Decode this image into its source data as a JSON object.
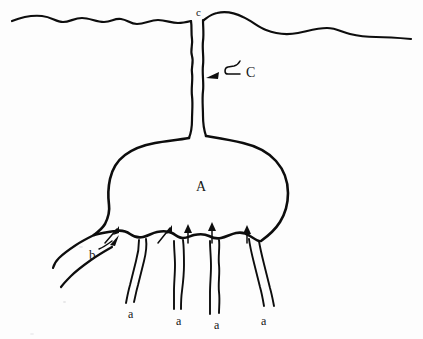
{
  "figure": {
    "type": "line-drawing-diagram",
    "background_color": "#fdfdfd",
    "ink_color": "#0d0d0d",
    "width": 423,
    "height": 339
  },
  "labels": {
    "body": "A",
    "neck_upper": "c",
    "neck_arrow": "C",
    "thick_root": "b",
    "roots": [
      "a",
      "a",
      "a",
      "a"
    ]
  },
  "label_positions": {
    "body": {
      "x": 196,
      "y": 180
    },
    "neck_upper": {
      "x": 196,
      "y": 7
    },
    "neck_arrow": {
      "x": 246,
      "y": 66
    },
    "thick_root": {
      "x": 89,
      "y": 248
    },
    "roots": [
      {
        "x": 128,
        "y": 308
      },
      {
        "x": 176,
        "y": 315
      },
      {
        "x": 214,
        "y": 319
      },
      {
        "x": 261,
        "y": 315
      }
    ]
  },
  "annotations": {
    "neck_arrow_direction": "left",
    "thick_root_arrow_direction": "up-right",
    "bulb_base_arrow_count": 5,
    "bulb_base_arrow_direction": "up"
  },
  "caption_items": [
    {
      "key": "A",
      "meaning": "main bulb body"
    },
    {
      "key": "c",
      "meaning": "neck opening at ground surface"
    },
    {
      "key": "C",
      "meaning": "vertical neck channel"
    },
    {
      "key": "b",
      "meaning": "thick lateral root"
    },
    {
      "key": "a",
      "meaning": "thin descending root"
    }
  ]
}
